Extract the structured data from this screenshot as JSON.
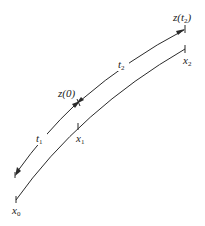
{
  "diagram": {
    "upper_curve": {
      "labels": {
        "z0": "z(0)",
        "zt2_main": "z(t",
        "zt2_sub": "2",
        "zt2_close": ")",
        "t1_main": "t",
        "t1_sub": "1",
        "t2_main": "t",
        "t2_sub": "2"
      }
    },
    "lower_curve": {
      "labels": {
        "x0_main": "x",
        "x0_sub": "0",
        "x1_main": "x",
        "x1_sub": "1",
        "x2_main": "x",
        "x2_sub": "2"
      }
    },
    "colors": {
      "stroke": "#2a2a2a",
      "background": "#ffffff"
    }
  }
}
